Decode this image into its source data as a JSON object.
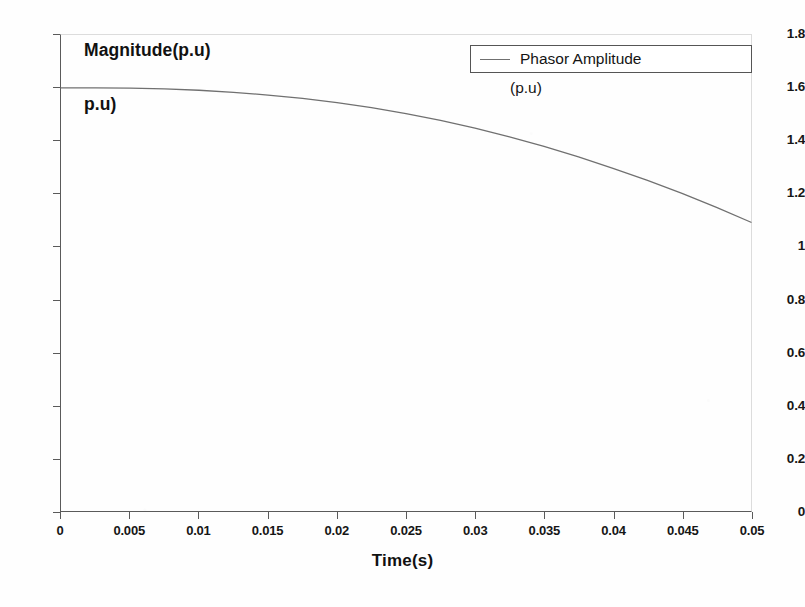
{
  "chart_data": {
    "type": "line",
    "title": "",
    "xlabel": "Time(s)",
    "ylabel": "Magnitude(p.u)",
    "ylabel_line2": "p.u)",
    "xlim": [
      0,
      0.05
    ],
    "ylim": [
      0,
      1.8
    ],
    "grid": false,
    "legend_position": "top-right",
    "xticks": [
      "0",
      "0.005",
      "0.01",
      "0.015",
      "0.02",
      "0.025",
      "0.03",
      "0.035",
      "0.04",
      "0.045",
      "0.05"
    ],
    "xtick_values": [
      0,
      0.005,
      0.01,
      0.015,
      0.02,
      0.025,
      0.03,
      0.035,
      0.04,
      0.045,
      0.05
    ],
    "yticks": [
      "0",
      "0.2",
      "0.4",
      "0.6",
      "0.8",
      "1",
      "1.2",
      "1.4",
      "1.6",
      "1.8"
    ],
    "ytick_values": [
      0,
      0.2,
      0.4,
      0.6,
      0.8,
      1.0,
      1.2,
      1.4,
      1.6,
      1.8
    ],
    "line_color": "#707070",
    "series": [
      {
        "name": "Phasor Amplitude",
        "name_sub": "(p.u)",
        "x": [
          0,
          0.0025,
          0.005,
          0.0075,
          0.01,
          0.0125,
          0.015,
          0.0175,
          0.02,
          0.0225,
          0.025,
          0.0275,
          0.03,
          0.0325,
          0.035,
          0.0375,
          0.04,
          0.0425,
          0.045,
          0.0475,
          0.05
        ],
        "values": [
          1.6,
          1.6,
          1.599,
          1.596,
          1.591,
          1.583,
          1.573,
          1.56,
          1.544,
          1.525,
          1.503,
          1.477,
          1.448,
          1.415,
          1.379,
          1.339,
          1.296,
          1.25,
          1.201,
          1.148,
          1.092
        ]
      }
    ]
  },
  "legend": {
    "label": "Phasor Amplitude",
    "sublabel": "(p.u)"
  },
  "axes": {
    "x_title": "Time(s)",
    "y_title_line1": "Magnitude(p.u)",
    "y_title_line2": "p.u)"
  }
}
